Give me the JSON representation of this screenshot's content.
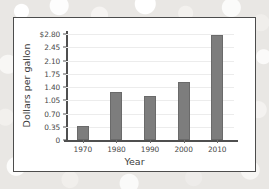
{
  "chart_data": {
    "type": "bar",
    "title": "",
    "xlabel": "Year",
    "ylabel": "Dollars per gallon",
    "categories": [
      "1970",
      "1980",
      "1990",
      "2000",
      "2010"
    ],
    "values": [
      0.38,
      1.26,
      1.17,
      1.53,
      2.78
    ],
    "ylim": [
      0,
      2.8
    ],
    "yticks": [
      0,
      0.35,
      0.7,
      1.05,
      1.4,
      1.75,
      2.1,
      2.45,
      2.8
    ],
    "ytick_labels": [
      "0",
      "0.35",
      "0.70",
      "1.05",
      "1.40",
      "1.75",
      "2.10",
      "2.45",
      "$2.80"
    ],
    "grid": true,
    "legend": "none",
    "bar_color": "#7d7d7d",
    "axis_color": "#4f4f4f",
    "gridline_color": "#ececec",
    "panel_background": "#ffffff",
    "panel_border_color": "#4c4c4c",
    "page_background": "#e9e7e4"
  }
}
